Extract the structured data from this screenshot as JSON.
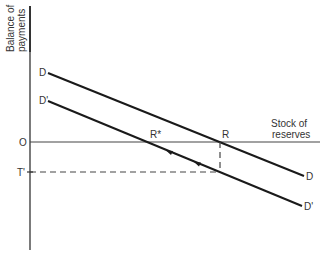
{
  "diagram": {
    "y_axis_label": [
      "Balance of",
      "payments"
    ],
    "x_axis_label": [
      "Stock of",
      "reserves"
    ],
    "origin_label": "O",
    "t_prime_label": "T'",
    "curves": [
      {
        "name": "D",
        "start_label": "D",
        "end_label": "D"
      },
      {
        "name": "D'",
        "start_label": "D'",
        "end_label": "D'"
      }
    ],
    "points": {
      "r_star": "R*",
      "r": "R"
    }
  }
}
